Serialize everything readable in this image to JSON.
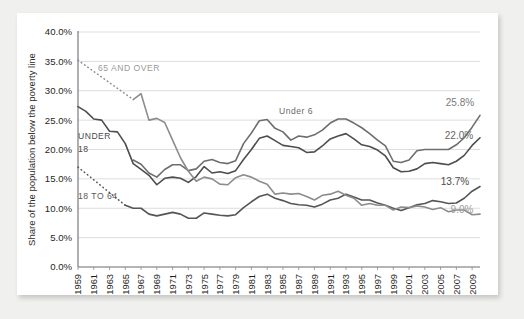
{
  "card": {
    "background": "#ffffff",
    "page_background": "#f0f0ef"
  },
  "chart_data": {
    "type": "line",
    "title": "",
    "xlabel": "",
    "ylabel": "Share of the population below the poverty line",
    "ylim": [
      0,
      40
    ],
    "ytick_labels": [
      "0.0%",
      "5.0%",
      "10.0%",
      "15.0%",
      "20.0%",
      "25.0%",
      "30.0%",
      "35.0%",
      "40.0%"
    ],
    "ytick_values": [
      0,
      5,
      10,
      15,
      20,
      25,
      30,
      35,
      40
    ],
    "grid": true,
    "legend_position": "inline-annotations",
    "xlim": [
      1959,
      2010
    ],
    "x": [
      1959,
      1960,
      1961,
      1962,
      1963,
      1964,
      1965,
      1966,
      1967,
      1968,
      1969,
      1970,
      1971,
      1972,
      1973,
      1974,
      1975,
      1976,
      1977,
      1978,
      1979,
      1980,
      1981,
      1982,
      1983,
      1984,
      1985,
      1986,
      1987,
      1988,
      1989,
      1990,
      1991,
      1992,
      1993,
      1994,
      1995,
      1996,
      1997,
      1998,
      1999,
      2000,
      2001,
      2002,
      2003,
      2004,
      2005,
      2006,
      2007,
      2008,
      2009,
      2010
    ],
    "xtick_labels": [
      "1959",
      "1961",
      "1963",
      "1965",
      "1967",
      "1969",
      "1971",
      "1973",
      "1975",
      "1977",
      "1979",
      "1981",
      "1983",
      "1985",
      "1987",
      "1989",
      "1991",
      "1993",
      "1995",
      "1997",
      "1999",
      "2001",
      "2003",
      "2005",
      "2007",
      "2009"
    ],
    "series": [
      {
        "name": "Under 6",
        "color": "#6e6e6e",
        "style": "solid",
        "width": 1.6,
        "values": [
          null,
          null,
          null,
          null,
          null,
          null,
          null,
          18.2,
          17.5,
          16.0,
          15.3,
          16.6,
          17.4,
          17.4,
          16.4,
          16.7,
          18.0,
          18.3,
          17.8,
          17.6,
          18.1,
          21.0,
          22.8,
          24.9,
          25.1,
          23.6,
          23.0,
          21.6,
          22.3,
          22.1,
          22.5,
          23.3,
          24.5,
          25.2,
          25.2,
          24.5,
          23.7,
          22.7,
          21.6,
          20.6,
          18.0,
          17.8,
          18.2,
          19.8,
          20.0,
          20.0,
          20.0,
          20.0,
          20.8,
          22.0,
          23.8,
          25.8
        ]
      },
      {
        "name": "Under 18",
        "color": "#4d4d4d",
        "style": "solid",
        "width": 1.6,
        "values": [
          27.3,
          26.5,
          25.2,
          25.0,
          23.1,
          23.0,
          21.0,
          17.6,
          16.6,
          15.6,
          14.0,
          15.1,
          15.3,
          15.1,
          14.4,
          15.4,
          17.1,
          16.0,
          16.2,
          15.9,
          16.4,
          18.3,
          20.0,
          21.9,
          22.3,
          21.5,
          20.7,
          20.5,
          20.3,
          19.5,
          19.6,
          20.6,
          21.8,
          22.3,
          22.7,
          21.8,
          20.8,
          20.5,
          19.9,
          18.9,
          16.9,
          16.2,
          16.3,
          16.7,
          17.6,
          17.8,
          17.6,
          17.4,
          18.0,
          19.0,
          20.7,
          22.0
        ]
      },
      {
        "name": "18 to 64",
        "color": "#555555",
        "style": "solid-dot-lead",
        "width": 1.6,
        "values": [
          17.0,
          null,
          null,
          null,
          null,
          null,
          10.5,
          10.0,
          10.0,
          9.0,
          8.7,
          9.0,
          9.3,
          9.0,
          8.3,
          8.3,
          9.2,
          9.0,
          8.8,
          8.7,
          8.9,
          10.1,
          11.1,
          12.0,
          12.4,
          11.7,
          11.3,
          10.8,
          10.6,
          10.5,
          10.2,
          10.7,
          11.4,
          11.7,
          12.4,
          11.9,
          11.4,
          11.4,
          10.9,
          10.5,
          10.0,
          9.6,
          10.1,
          10.6,
          10.8,
          11.3,
          11.1,
          10.8,
          10.9,
          11.7,
          12.9,
          13.7
        ]
      },
      {
        "name": "65 and over",
        "color": "#8c8c8c",
        "style": "solid-dot-lead",
        "width": 1.6,
        "values": [
          35.2,
          null,
          null,
          null,
          null,
          null,
          null,
          28.5,
          29.5,
          25.0,
          25.3,
          24.6,
          21.6,
          18.6,
          16.3,
          14.6,
          15.3,
          15.0,
          14.1,
          14.0,
          15.2,
          15.7,
          15.3,
          14.6,
          14.1,
          12.4,
          12.6,
          12.4,
          12.5,
          12.0,
          11.4,
          12.2,
          12.4,
          12.9,
          12.2,
          11.7,
          10.5,
          10.8,
          10.5,
          10.5,
          9.7,
          10.2,
          10.1,
          10.4,
          10.2,
          9.8,
          10.1,
          9.4,
          9.7,
          9.7,
          8.9,
          9.0
        ]
      }
    ],
    "annotations": [
      {
        "text": "65 AND OVER",
        "color": "#9a9a9a",
        "x_px": 98,
        "y_px": 71
      },
      {
        "text": "UNDER",
        "color": "#4a4a4a",
        "x_px": 78,
        "y_px": 139
      },
      {
        "text": "18",
        "color": "#4a4a4a",
        "x_px": 78,
        "y_px": 152
      },
      {
        "text": "18 TO 64",
        "color": "#5a5a5a",
        "x_px": 78,
        "y_px": 199
      },
      {
        "text": "Under 6",
        "color": "#6a6a6a",
        "x_px": 279,
        "y_px": 114
      }
    ],
    "value_labels": [
      {
        "text": "25.8%",
        "color": "#7c7c7c",
        "x_px": 460,
        "y_px": 106
      },
      {
        "text": "22.0%",
        "color": "#666666",
        "x_px": 459,
        "y_px": 139
      },
      {
        "text": "13.7%",
        "color": "#4d4d4d",
        "x_px": 455,
        "y_px": 185
      },
      {
        "text": "9.0%",
        "color": "#9a9a9a",
        "x_px": 462,
        "y_px": 213
      }
    ]
  }
}
